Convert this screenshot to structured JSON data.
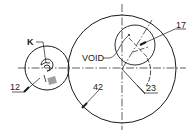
{
  "diagram": {
    "type": "technical-drawing",
    "labels": {
      "k": "K",
      "void": "VOID",
      "ref_12": "12",
      "ref_42": "42",
      "ref_17": "17",
      "ref_23": "23"
    },
    "colors": {
      "line": "#1a1a1a",
      "block": "#a0a0a0",
      "background": "#ffffff"
    }
  }
}
